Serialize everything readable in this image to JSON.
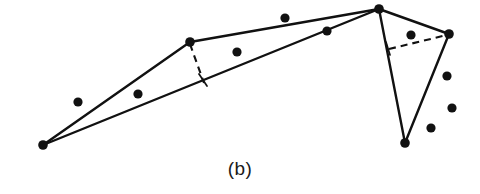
{
  "figure": {
    "caption": "(b)",
    "width": 480,
    "height": 194,
    "background_color": "#ffffff",
    "ink_color": "#111111"
  },
  "chart_data": {
    "type": "scatter",
    "title": "",
    "subtitle": "",
    "xlabel": "",
    "ylabel": "",
    "xlim": [
      0,
      480
    ],
    "ylim": [
      194,
      0
    ],
    "grid": false,
    "legend": "none",
    "annotations": [
      "(b)"
    ],
    "note": "Point set with a partial convex-hull / polyline overlay and two dashed construction segments",
    "hull_vertices": [
      {
        "label": "A",
        "x": 43,
        "y": 145
      },
      {
        "label": "B",
        "x": 190,
        "y": 42
      },
      {
        "label": "C",
        "x": 379,
        "y": 9
      },
      {
        "label": "D",
        "x": 449,
        "y": 34
      },
      {
        "label": "E",
        "x": 405,
        "y": 143
      }
    ],
    "solid_edges": [
      {
        "from": "A",
        "to": "B"
      },
      {
        "from": "B",
        "to": "C"
      },
      {
        "from": "A",
        "to": "C"
      },
      {
        "from": "C",
        "to": "D"
      },
      {
        "from": "C",
        "to": "E"
      },
      {
        "from": "D",
        "to": "E"
      }
    ],
    "dashed_edges": [
      {
        "from": {
          "x": 190,
          "y": 44
        },
        "to": {
          "x": 204,
          "y": 83
        }
      },
      {
        "from": {
          "x": 389,
          "y": 49
        },
        "to": {
          "x": 447,
          "y": 35
        }
      }
    ],
    "tick_marks": [
      {
        "from": {
          "x": 199,
          "y": 74
        },
        "to": {
          "x": 207,
          "y": 86
        }
      },
      {
        "from": {
          "x": 386,
          "y": 42
        },
        "to": {
          "x": 390,
          "y": 55
        }
      }
    ],
    "interior_points": [
      {
        "x": 78,
        "y": 102
      },
      {
        "x": 138,
        "y": 94
      },
      {
        "x": 237,
        "y": 52
      },
      {
        "x": 285,
        "y": 18
      },
      {
        "x": 327,
        "y": 31
      },
      {
        "x": 411,
        "y": 35
      },
      {
        "x": 447,
        "y": 76
      },
      {
        "x": 452,
        "y": 108
      },
      {
        "x": 431,
        "y": 128
      }
    ],
    "point_radius": 4.6,
    "vertex_radius": 4.8
  }
}
